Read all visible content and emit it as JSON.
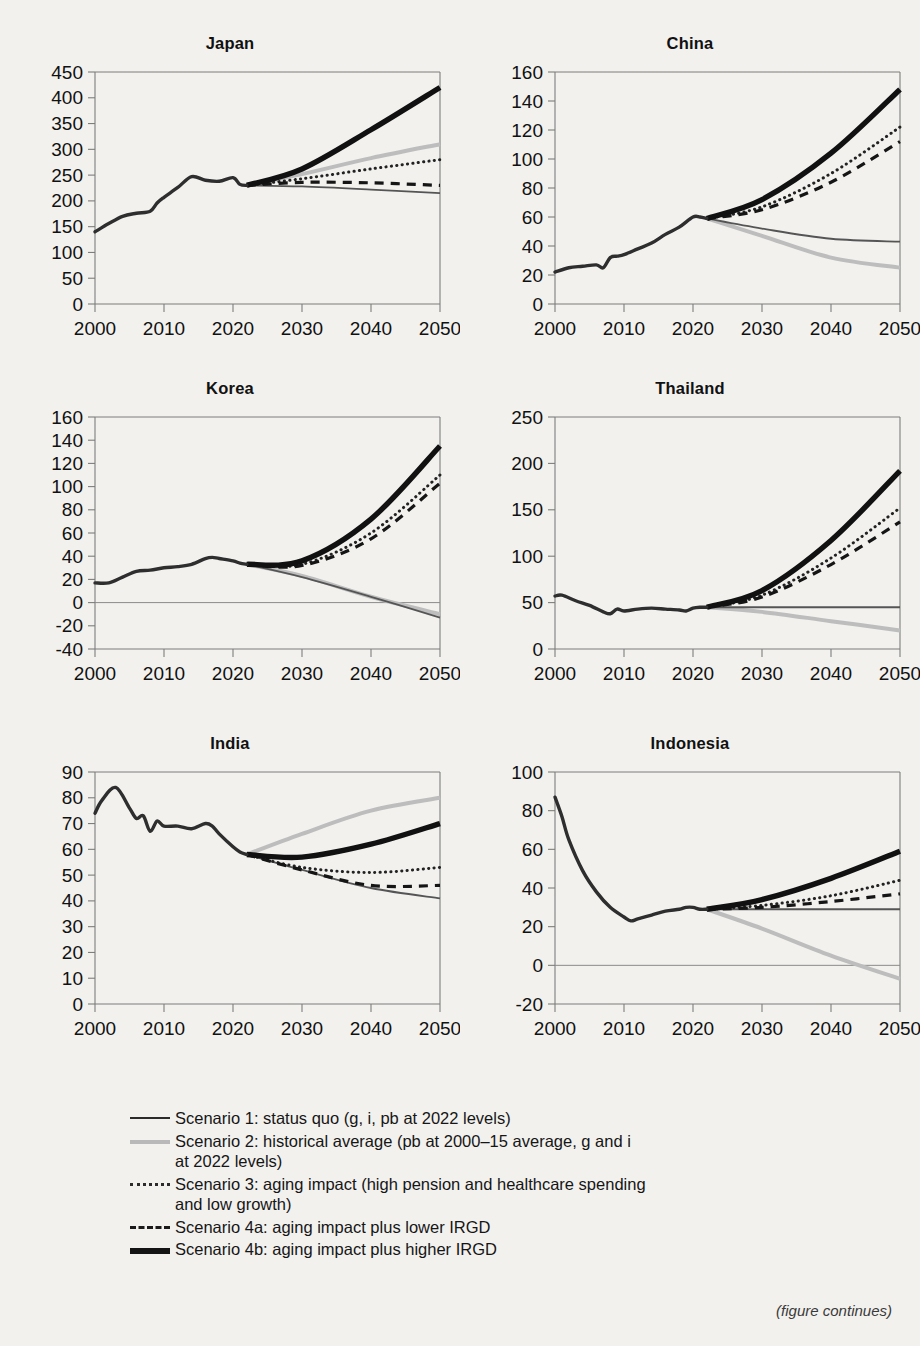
{
  "figure": {
    "footer_note": "(figure continues)",
    "x_ticks": [
      "2000",
      "2010",
      "2020",
      "2030",
      "2040",
      "2050"
    ]
  },
  "legend": {
    "items": [
      {
        "key": "scenario-1",
        "style": "solid-thin-dark",
        "text": "Scenario 1: status quo (g, i, pb at 2022 levels)"
      },
      {
        "key": "scenario-2",
        "style": "solid-thick-gray",
        "text": "Scenario 2: historical average (pb at 2000–15 average, g and i",
        "text2": "at 2022 levels)"
      },
      {
        "key": "scenario-3",
        "style": "dotted-dark",
        "text": "Scenario 3: aging impact (high pension and healthcare spending",
        "text2": "and low growth)"
      },
      {
        "key": "scenario-4a",
        "style": "dashed-dark",
        "text": "Scenario 4a: aging impact plus lower IRGD"
      },
      {
        "key": "scenario-4b",
        "style": "solid-heavy-black",
        "text": "Scenario 4b: aging impact plus higher IRGD"
      }
    ]
  },
  "chart_data": [
    {
      "type": "line",
      "title": "Japan",
      "xlabel": "",
      "ylabel": "",
      "xlim": [
        2000,
        2050
      ],
      "ylim": [
        0,
        450
      ],
      "yticks": [
        0,
        50,
        100,
        150,
        200,
        250,
        300,
        350,
        400,
        450
      ],
      "xticks": [
        2000,
        2010,
        2020,
        2030,
        2040,
        2050
      ],
      "grid": false,
      "zero_line": false,
      "history": {
        "x": [
          2000,
          2002,
          2004,
          2006,
          2008,
          2009,
          2010,
          2012,
          2014,
          2016,
          2018,
          2020,
          2021,
          2022
        ],
        "y": [
          140,
          156,
          170,
          176,
          180,
          196,
          207,
          226,
          247,
          240,
          238,
          245,
          232,
          230
        ]
      },
      "series": [
        {
          "name": "Scenario 1",
          "x": [
            2022,
            2030,
            2040,
            2050
          ],
          "y": [
            230,
            228,
            222,
            215
          ]
        },
        {
          "name": "Scenario 2",
          "x": [
            2022,
            2030,
            2040,
            2050
          ],
          "y": [
            230,
            252,
            283,
            310
          ]
        },
        {
          "name": "Scenario 3",
          "x": [
            2022,
            2030,
            2040,
            2050
          ],
          "y": [
            230,
            243,
            262,
            280
          ]
        },
        {
          "name": "Scenario 4a",
          "x": [
            2022,
            2030,
            2040,
            2050
          ],
          "y": [
            230,
            236,
            235,
            230
          ]
        },
        {
          "name": "Scenario 4b",
          "x": [
            2022,
            2030,
            2040,
            2050
          ],
          "y": [
            230,
            262,
            338,
            420
          ]
        }
      ]
    },
    {
      "type": "line",
      "title": "China",
      "xlim": [
        2000,
        2050
      ],
      "ylim": [
        0,
        160
      ],
      "yticks": [
        0,
        20,
        40,
        60,
        80,
        100,
        120,
        140,
        160
      ],
      "xticks": [
        2000,
        2010,
        2020,
        2030,
        2040,
        2050
      ],
      "grid": false,
      "zero_line": false,
      "history": {
        "x": [
          2000,
          2002,
          2004,
          2006,
          2007,
          2008,
          2009,
          2010,
          2012,
          2014,
          2016,
          2018,
          2020,
          2021,
          2022
        ],
        "y": [
          22,
          25,
          26,
          27,
          25,
          32,
          33,
          34,
          38,
          42,
          48,
          53,
          60,
          60,
          59
        ]
      },
      "series": [
        {
          "name": "Scenario 1",
          "x": [
            2022,
            2030,
            2040,
            2050
          ],
          "y": [
            59,
            52,
            45,
            43
          ]
        },
        {
          "name": "Scenario 2",
          "x": [
            2022,
            2030,
            2040,
            2050
          ],
          "y": [
            59,
            47,
            32,
            25
          ]
        },
        {
          "name": "Scenario 3",
          "x": [
            2022,
            2030,
            2040,
            2050
          ],
          "y": [
            59,
            67,
            90,
            122
          ]
        },
        {
          "name": "Scenario 4a",
          "x": [
            2022,
            2030,
            2040,
            2050
          ],
          "y": [
            59,
            65,
            84,
            112
          ]
        },
        {
          "name": "Scenario 4b",
          "x": [
            2022,
            2030,
            2040,
            2050
          ],
          "y": [
            59,
            72,
            104,
            148
          ]
        }
      ]
    },
    {
      "type": "line",
      "title": "Korea",
      "xlim": [
        2000,
        2050
      ],
      "ylim": [
        -40,
        160
      ],
      "yticks": [
        -40,
        -20,
        0,
        20,
        40,
        60,
        80,
        100,
        120,
        140,
        160
      ],
      "xticks": [
        2000,
        2010,
        2020,
        2030,
        2040,
        2050
      ],
      "grid": false,
      "zero_line": true,
      "history": {
        "x": [
          2000,
          2002,
          2004,
          2006,
          2008,
          2010,
          2012,
          2014,
          2016,
          2017,
          2018,
          2020,
          2021,
          2022
        ],
        "y": [
          17,
          17,
          22,
          27,
          28,
          30,
          31,
          33,
          38,
          39,
          38,
          36,
          34,
          33
        ]
      },
      "series": [
        {
          "name": "Scenario 1",
          "x": [
            2022,
            2030,
            2040,
            2050
          ],
          "y": [
            33,
            22,
            5,
            -13
          ]
        },
        {
          "name": "Scenario 2",
          "x": [
            2022,
            2030,
            2040,
            2050
          ],
          "y": [
            33,
            23,
            5,
            -10
          ]
        },
        {
          "name": "Scenario 3",
          "x": [
            2022,
            2030,
            2040,
            2050
          ],
          "y": [
            33,
            33,
            60,
            110
          ]
        },
        {
          "name": "Scenario 4a",
          "x": [
            2022,
            2030,
            2040,
            2050
          ],
          "y": [
            33,
            32,
            55,
            103
          ]
        },
        {
          "name": "Scenario 4b",
          "x": [
            2022,
            2030,
            2040,
            2050
          ],
          "y": [
            33,
            36,
            72,
            135
          ]
        }
      ]
    },
    {
      "type": "line",
      "title": "Thailand",
      "xlim": [
        2000,
        2050
      ],
      "ylim": [
        0,
        250
      ],
      "yticks": [
        0,
        50,
        100,
        150,
        200,
        250
      ],
      "xticks": [
        2000,
        2010,
        2020,
        2030,
        2040,
        2050
      ],
      "grid": false,
      "zero_line": false,
      "history": {
        "x": [
          2000,
          2001,
          2003,
          2005,
          2007,
          2008,
          2009,
          2010,
          2012,
          2014,
          2016,
          2018,
          2019,
          2020,
          2021,
          2022
        ],
        "y": [
          57,
          58,
          52,
          47,
          40,
          38,
          43,
          41,
          43,
          44,
          43,
          42,
          41,
          44,
          45,
          45
        ]
      },
      "series": [
        {
          "name": "Scenario 1",
          "x": [
            2022,
            2030,
            2040,
            2050
          ],
          "y": [
            45,
            45,
            45,
            45
          ]
        },
        {
          "name": "Scenario 2",
          "x": [
            2022,
            2030,
            2040,
            2050
          ],
          "y": [
            45,
            40,
            30,
            20
          ]
        },
        {
          "name": "Scenario 3",
          "x": [
            2022,
            2030,
            2040,
            2050
          ],
          "y": [
            45,
            58,
            98,
            152
          ]
        },
        {
          "name": "Scenario 4a",
          "x": [
            2022,
            2030,
            2040,
            2050
          ],
          "y": [
            45,
            56,
            91,
            137
          ]
        },
        {
          "name": "Scenario 4b",
          "x": [
            2022,
            2030,
            2040,
            2050
          ],
          "y": [
            45,
            63,
            117,
            192
          ]
        }
      ]
    },
    {
      "type": "line",
      "title": "India",
      "xlim": [
        2000,
        2050
      ],
      "ylim": [
        0,
        90
      ],
      "yticks": [
        0,
        10,
        20,
        30,
        40,
        50,
        60,
        70,
        80,
        90
      ],
      "xticks": [
        2000,
        2010,
        2020,
        2030,
        2040,
        2050
      ],
      "grid": false,
      "zero_line": false,
      "history": {
        "x": [
          2000,
          2001,
          2003,
          2005,
          2006,
          2007,
          2008,
          2009,
          2010,
          2012,
          2014,
          2016,
          2017,
          2018,
          2020,
          2021,
          2022
        ],
        "y": [
          74,
          79,
          84,
          76,
          72,
          73,
          67,
          71,
          69,
          69,
          68,
          70,
          69,
          66,
          61,
          59,
          58
        ]
      },
      "series": [
        {
          "name": "Scenario 1",
          "x": [
            2022,
            2030,
            2040,
            2050
          ],
          "y": [
            58,
            52,
            45,
            41
          ]
        },
        {
          "name": "Scenario 2",
          "x": [
            2022,
            2030,
            2040,
            2050
          ],
          "y": [
            58,
            66,
            75,
            80
          ]
        },
        {
          "name": "Scenario 3",
          "x": [
            2022,
            2030,
            2040,
            2050
          ],
          "y": [
            58,
            53,
            51,
            53
          ]
        },
        {
          "name": "Scenario 4a",
          "x": [
            2022,
            2030,
            2040,
            2050
          ],
          "y": [
            58,
            52,
            46,
            46
          ]
        },
        {
          "name": "Scenario 4b",
          "x": [
            2022,
            2030,
            2040,
            2050
          ],
          "y": [
            58,
            57,
            62,
            70
          ]
        }
      ]
    },
    {
      "type": "line",
      "title": "Indonesia",
      "xlim": [
        2000,
        2050
      ],
      "ylim": [
        -20,
        100
      ],
      "yticks": [
        -20,
        0,
        20,
        40,
        60,
        80,
        100
      ],
      "xticks": [
        2000,
        2010,
        2020,
        2030,
        2040,
        2050
      ],
      "grid": false,
      "zero_line": true,
      "history": {
        "x": [
          2000,
          2001,
          2002,
          2004,
          2006,
          2008,
          2010,
          2011,
          2012,
          2014,
          2016,
          2018,
          2019,
          2020,
          2021,
          2022
        ],
        "y": [
          87,
          77,
          65,
          49,
          38,
          30,
          25,
          23,
          24,
          26,
          28,
          29,
          30,
          30,
          29,
          29
        ]
      },
      "series": [
        {
          "name": "Scenario 1",
          "x": [
            2022,
            2030,
            2040,
            2050
          ],
          "y": [
            29,
            29,
            29,
            29
          ]
        },
        {
          "name": "Scenario 2",
          "x": [
            2022,
            2030,
            2040,
            2050
          ],
          "y": [
            29,
            19,
            5,
            -7
          ]
        },
        {
          "name": "Scenario 3",
          "x": [
            2022,
            2030,
            2040,
            2050
          ],
          "y": [
            29,
            31,
            36,
            44
          ]
        },
        {
          "name": "Scenario 4a",
          "x": [
            2022,
            2030,
            2040,
            2050
          ],
          "y": [
            29,
            30,
            33,
            37
          ]
        },
        {
          "name": "Scenario 4b",
          "x": [
            2022,
            2030,
            2040,
            2050
          ],
          "y": [
            29,
            34,
            45,
            59
          ]
        }
      ]
    }
  ]
}
